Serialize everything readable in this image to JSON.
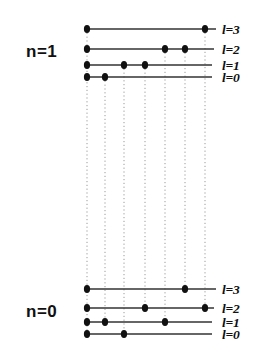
{
  "figure": {
    "background_color": "#ffffff",
    "line_color": "#333333",
    "dot_color": "#111111",
    "connector_color": "#9a9a9a"
  },
  "groups": [
    {
      "id": "n1",
      "n_label": "n=1",
      "n_label_x": 26,
      "n_label_y": 42,
      "levels": [
        {
          "l_label": "l=3",
          "y": 29,
          "x_start": 84,
          "x_end": 216,
          "label_x": 222,
          "label_y": 22,
          "dots_x": [
            87,
            205
          ]
        },
        {
          "l_label": "l=2",
          "y": 49,
          "x_start": 84,
          "x_end": 214,
          "label_x": 222,
          "label_y": 42,
          "dots_x": [
            87,
            165,
            185
          ]
        },
        {
          "l_label": "l=1",
          "y": 65,
          "x_start": 84,
          "x_end": 212,
          "label_x": 222,
          "label_y": 58,
          "dots_x": [
            87,
            124,
            145
          ]
        },
        {
          "l_label": "l=0",
          "y": 77,
          "x_start": 84,
          "x_end": 212,
          "label_x": 222,
          "label_y": 70,
          "dots_x": [
            87,
            105
          ]
        }
      ]
    },
    {
      "id": "n0",
      "n_label": "n=0",
      "n_label_x": 26,
      "n_label_y": 302,
      "levels": [
        {
          "l_label": "l=3",
          "y": 289,
          "x_start": 84,
          "x_end": 216,
          "label_x": 222,
          "label_y": 282,
          "dots_x": [
            87,
            185
          ]
        },
        {
          "l_label": "l=2",
          "y": 308,
          "x_start": 84,
          "x_end": 214,
          "label_x": 222,
          "label_y": 301,
          "dots_x": [
            87,
            145,
            205
          ]
        },
        {
          "l_label": "l=1",
          "y": 322,
          "x_start": 84,
          "x_end": 212,
          "label_x": 222,
          "label_y": 315,
          "dots_x": [
            87,
            105,
            165
          ]
        },
        {
          "l_label": "l=0",
          "y": 334,
          "x_start": 84,
          "x_end": 212,
          "label_x": 222,
          "label_y": 327,
          "dots_x": [
            87,
            124
          ]
        }
      ]
    }
  ],
  "connectors": [
    {
      "x": 87,
      "y_top": 29,
      "y_bottom": 334
    },
    {
      "x": 105,
      "y_top": 77,
      "y_bottom": 322
    },
    {
      "x": 124,
      "y_top": 65,
      "y_bottom": 334
    },
    {
      "x": 145,
      "y_top": 65,
      "y_bottom": 308
    },
    {
      "x": 165,
      "y_top": 49,
      "y_bottom": 322
    },
    {
      "x": 185,
      "y_top": 49,
      "y_bottom": 289
    },
    {
      "x": 205,
      "y_top": 29,
      "y_bottom": 308
    }
  ],
  "chart_data": {
    "type": "scatter",
    "xlabel": "",
    "ylabel": "",
    "legend": [],
    "grid": false,
    "series": [
      {
        "name": "n=1, l=3",
        "x": [
          87,
          205
        ],
        "y": [
          29,
          29
        ]
      },
      {
        "name": "n=1, l=2",
        "x": [
          87,
          165,
          185
        ],
        "y": [
          49,
          49,
          49
        ]
      },
      {
        "name": "n=1, l=1",
        "x": [
          87,
          124,
          145
        ],
        "y": [
          65,
          65,
          65
        ]
      },
      {
        "name": "n=1, l=0",
        "x": [
          87,
          105
        ],
        "y": [
          77,
          77
        ]
      },
      {
        "name": "n=0, l=3",
        "x": [
          87,
          185
        ],
        "y": [
          289,
          289
        ]
      },
      {
        "name": "n=0, l=2",
        "x": [
          87,
          145,
          205
        ],
        "y": [
          308,
          308,
          308
        ]
      },
      {
        "name": "n=0, l=1",
        "x": [
          87,
          105,
          165
        ],
        "y": [
          322,
          322,
          322
        ]
      },
      {
        "name": "n=0, l=0",
        "x": [
          87,
          124
        ],
        "y": [
          334,
          334
        ]
      }
    ],
    "annotations": [
      "n=1",
      "n=0",
      "l=3",
      "l=2",
      "l=1",
      "l=0"
    ]
  }
}
